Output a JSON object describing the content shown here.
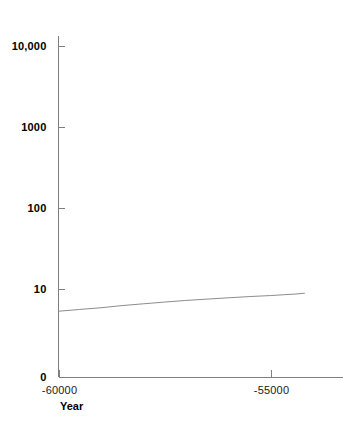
{
  "chart_data": {
    "type": "line",
    "title": "",
    "subtitle": "",
    "xlabel": "Year",
    "ylabel": "",
    "yscale": "log-with-zero-baseline",
    "grid": false,
    "legend": null,
    "background_color": "#ffffff",
    "line_color": "#8c8c8c",
    "axis_color": "#7f7f7f",
    "text_color": "#000000",
    "xlim": [
      -60000,
      -54200
    ],
    "ylim": [
      0,
      10000
    ],
    "y_ticks": [
      {
        "value": 10000,
        "label": "10,000"
      },
      {
        "value": 1000,
        "label": "1000"
      },
      {
        "value": 100,
        "label": "100"
      },
      {
        "value": 10,
        "label": "10"
      },
      {
        "value": 0,
        "label": "0"
      }
    ],
    "x_ticks": [
      {
        "value": -60000,
        "label": "-60000"
      },
      {
        "value": -55000,
        "label": "-55000"
      }
    ],
    "series": [
      {
        "name": "population",
        "x": [
          -60000,
          -59500,
          -59000,
          -58500,
          -58000,
          -57500,
          -57000,
          -56500,
          -56000,
          -55500,
          -55000,
          -54700,
          -54400,
          -54200
        ],
        "values": [
          5.0,
          5.3,
          5.6,
          6.0,
          6.35,
          6.7,
          7.05,
          7.35,
          7.65,
          7.95,
          8.2,
          8.4,
          8.6,
          8.8
        ]
      }
    ]
  },
  "axis_titles": {
    "x": "Year"
  }
}
